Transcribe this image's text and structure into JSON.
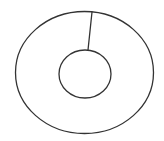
{
  "diagram": {
    "stroke_color": "#333333",
    "background": "#ffffff",
    "shapes": {
      "outer_ellipse": {
        "cx": 84.5,
        "cy": 72.5,
        "rx": 69,
        "ry": 61
      },
      "inner_circle": {
        "cx": 85,
        "cy": 74,
        "rx": 26,
        "ry": 24
      },
      "connector_line": {
        "x1": 92,
        "y1": 12,
        "x2": 88,
        "y2": 50
      }
    }
  }
}
